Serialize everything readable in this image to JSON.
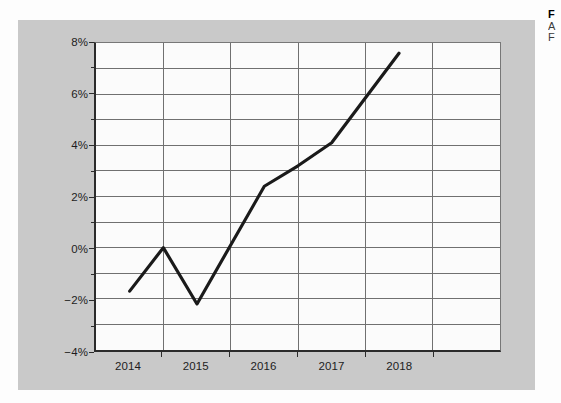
{
  "caption": {
    "title": "F",
    "line2": "A",
    "line3": "F"
  },
  "chart_data": {
    "type": "line",
    "title": "",
    "xlabel": "",
    "ylabel": "",
    "categories": [
      "2014",
      "2015",
      "2016",
      "2017",
      "2018"
    ],
    "series": [
      {
        "name": "",
        "values": [
          -1.7,
          -2.2,
          2.4,
          4.1,
          7.6
        ],
        "color": "#1a1a1a"
      }
    ],
    "intermediate_points": [
      {
        "x_fraction": 0.5,
        "value": 0.0
      },
      {
        "x_fraction": 2.5,
        "value": 3.2
      }
    ],
    "ylim": [
      -4,
      8
    ],
    "ytick_values": [
      8,
      6,
      4,
      2,
      0,
      -2,
      -4
    ],
    "ytick_labels": [
      "8%",
      "6%",
      "4%",
      "2%",
      "0%",
      "-2%",
      "-4%"
    ],
    "yminor_values": [
      7,
      5,
      3,
      1,
      -1,
      -3
    ],
    "xtick_labels": [
      "2014",
      "2015",
      "2016",
      "2017",
      "2018"
    ],
    "grid": true,
    "grid_color": "#6f6f6f",
    "legend": "none",
    "plot_background": "#fbfbfb",
    "panel_background": "#c9c9c9"
  }
}
